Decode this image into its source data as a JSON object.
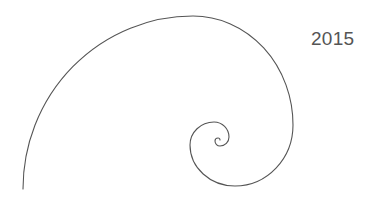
{
  "label": {
    "year": "2015"
  },
  "graphic": {
    "name": "golden-spiral",
    "stroke_color": "#555555"
  }
}
